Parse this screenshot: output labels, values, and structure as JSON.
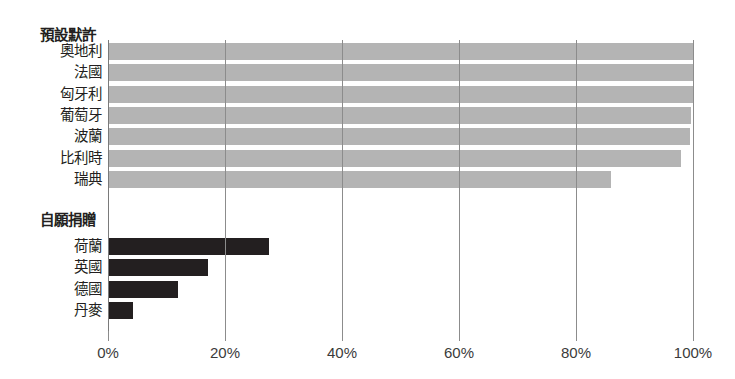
{
  "chart_data": {
    "type": "bar",
    "orientation": "horizontal",
    "title": "",
    "xlabel": "",
    "ylabel": "",
    "xlim": [
      0,
      100
    ],
    "xticks": [
      "0%",
      "20%",
      "40%",
      "60%",
      "80%",
      "100%"
    ],
    "xtick_values": [
      0,
      20,
      40,
      60,
      80,
      100
    ],
    "grid": "vertical",
    "legend": "none",
    "groups": [
      {
        "name": "預設默許",
        "color": "#b4b4b4",
        "categories": [
          "奧地利",
          "法國",
          "匈牙利",
          "葡萄牙",
          "波蘭",
          "比利時",
          "瑞典"
        ],
        "values": [
          99.98,
          99.97,
          99.97,
          99.64,
          99.5,
          98.0,
          85.9
        ]
      },
      {
        "name": "自願捐贈",
        "color": "#231f20",
        "categories": [
          "荷蘭",
          "英國",
          "德國",
          "丹麥"
        ],
        "values": [
          27.5,
          17.17,
          12.0,
          4.25
        ]
      }
    ]
  },
  "axis": {
    "ticks": [
      {
        "label": "0%",
        "value": 0
      },
      {
        "label": "20%",
        "value": 20
      },
      {
        "label": "40%",
        "value": 40
      },
      {
        "label": "60%",
        "value": 60
      },
      {
        "label": "80%",
        "value": 80
      },
      {
        "label": "100%",
        "value": 100
      }
    ]
  },
  "colors": {
    "default_allow_bar": "#b4b4b4",
    "voluntary_bar": "#231f20",
    "gridline": "#8c8c8c",
    "text": "#231f20",
    "background": "#ffffff"
  }
}
